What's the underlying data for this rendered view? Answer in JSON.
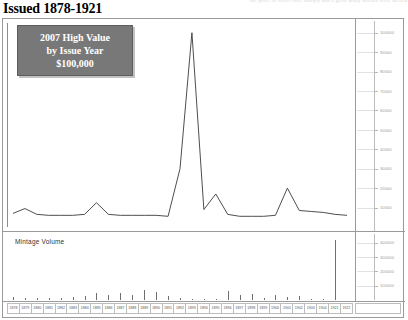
{
  "running_head": "the price of silver rose sharply and a great many dollars were melted",
  "page_title": "Issued 1878-1921",
  "legend": {
    "line1": "2007 High Value",
    "line2": "by Issue Year",
    "line3": "$100,000"
  },
  "mintage_label": "Mintage Volume",
  "chart_data": {
    "type": "line",
    "title": "Issued 1878-1921",
    "xlabel": "",
    "ylabel": "2007 High Value",
    "ylim": [
      0,
      105000
    ],
    "grid": true,
    "legend_position": "top-left",
    "categories": [
      "1878",
      "1879",
      "1880",
      "1881",
      "1882",
      "1883",
      "1884",
      "1885",
      "1886",
      "1887",
      "1888",
      "1889",
      "1890",
      "1891",
      "1892",
      "1893",
      "1894",
      "1895",
      "1896",
      "1897",
      "1898",
      "1899",
      "1900",
      "1901",
      "1902",
      "1903",
      "1904",
      "1921",
      "1922"
    ],
    "ytick_labels": [
      "100000",
      "90000",
      "80000",
      "70000",
      "60000",
      "50000",
      "40000",
      "30000",
      "20000",
      "10000"
    ],
    "ytick_values": [
      100000,
      90000,
      80000,
      70000,
      60000,
      50000,
      40000,
      30000,
      20000,
      10000
    ],
    "values": [
      7000,
      9500,
      6500,
      6000,
      6000,
      6000,
      6500,
      12500,
      6500,
      6000,
      6000,
      6000,
      6000,
      5500,
      30000,
      100000,
      9000,
      17000,
      6500,
      5500,
      5500,
      5500,
      6000,
      20000,
      8500,
      8000,
      7500,
      6500,
      6000
    ],
    "secondary": {
      "type": "bar",
      "title": "Mintage Volume",
      "ylim": [
        0,
        460000
      ],
      "ytick_labels": [
        "400000",
        "300000",
        "200000",
        "100000"
      ],
      "ytick_values": [
        400000,
        300000,
        200000,
        100000
      ],
      "categories": [
        "1878",
        "1879",
        "1880",
        "1881",
        "1882",
        "1883",
        "1884",
        "1885",
        "1886",
        "1887",
        "1888",
        "1889",
        "1890",
        "1891",
        "1892",
        "1893",
        "1894",
        "1895",
        "1896",
        "1897",
        "1898",
        "1899",
        "1900",
        "1901",
        "1902",
        "1903",
        "1904",
        "1921",
        "1922"
      ],
      "values": [
        22000,
        14000,
        12000,
        13000,
        16000,
        18000,
        28000,
        49000,
        35000,
        48000,
        33000,
        72000,
        58000,
        30000,
        12000,
        6000,
        10000,
        8000,
        60000,
        36000,
        40000,
        17000,
        38000,
        21000,
        27000,
        9000,
        10000,
        420000,
        0
      ]
    }
  }
}
